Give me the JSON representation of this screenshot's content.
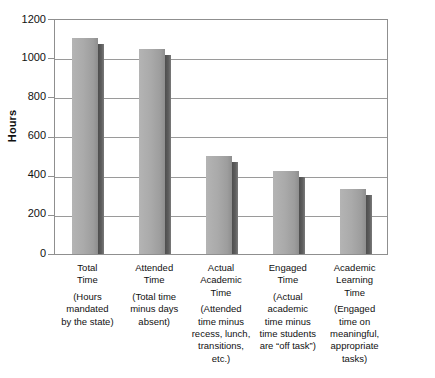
{
  "chart_data": {
    "type": "bar",
    "title": "",
    "xlabel": "",
    "ylabel": "Hours",
    "ylim": [
      0,
      1200
    ],
    "ytick_values": [
      1200,
      1000,
      800,
      600,
      400,
      200,
      0
    ],
    "ytick_labels": [
      "1200",
      "1000",
      "800",
      "600",
      "400",
      "200",
      "0"
    ],
    "grid": true,
    "legend": "none",
    "categories": [
      "Total Time",
      "Attended Time",
      "Actual Academic Time",
      "Engaged Time",
      "Academic Learning Time"
    ],
    "values": [
      1098,
      1042,
      500,
      424,
      332
    ],
    "bar_labels": [
      {
        "name_lines": [
          "Total",
          "Time"
        ],
        "desc_lines": [
          "(Hours",
          "mandated",
          "by the state)"
        ]
      },
      {
        "name_lines": [
          "Attended",
          "Time"
        ],
        "desc_lines": [
          "(Total time",
          "minus days",
          "absent)"
        ]
      },
      {
        "name_lines": [
          "Actual",
          "Academic",
          "Time"
        ],
        "desc_lines": [
          "(Attended",
          "time minus",
          "recess, lunch,",
          "transitions,",
          "etc.)"
        ]
      },
      {
        "name_lines": [
          "Engaged",
          "Time"
        ],
        "desc_lines": [
          "(Actual",
          "academic",
          "time minus",
          "time students",
          "are “off task”)"
        ]
      },
      {
        "name_lines": [
          "Academic",
          "Learning",
          "Time"
        ],
        "desc_lines": [
          "(Engaged",
          "time on",
          "meaningful,",
          "appropriate",
          "tasks)"
        ]
      }
    ],
    "colors": {
      "bar_face": "#aaaaaa",
      "bar_shadow": "#5a5a5a",
      "gridline": "#9a9a9a",
      "axis": "#8f8f8f",
      "text": "#111111",
      "background": "#ffffff"
    }
  }
}
